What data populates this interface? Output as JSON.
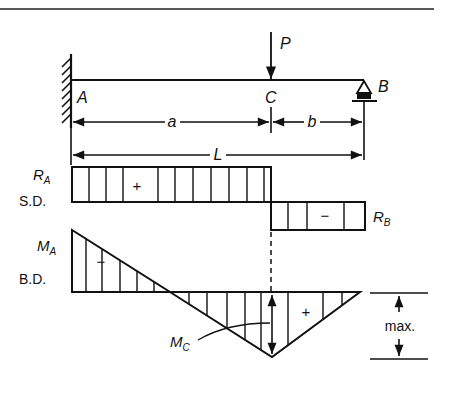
{
  "diagram": {
    "beam": {
      "left_support": "fixed wall",
      "right_support": "roller",
      "points": {
        "A": "A",
        "B": "B",
        "C": "C"
      },
      "load": "P"
    },
    "dimensions": {
      "a": "a",
      "b": "b",
      "L": "L"
    },
    "shear_diagram": {
      "label": "S.D.",
      "left_value": "R",
      "left_sub": "A",
      "right_value": "R",
      "right_sub": "B",
      "positive_sign": "+",
      "negative_sign": "−"
    },
    "moment_diagram": {
      "label": "B.D.",
      "left_value": "M",
      "left_sub": "A",
      "point_value": "M",
      "point_sub": "C",
      "negative_sign": "−",
      "positive_sign": "+",
      "max_label": "max."
    }
  }
}
